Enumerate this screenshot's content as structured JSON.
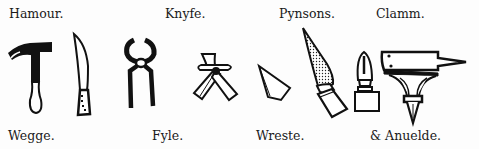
{
  "illustration": {
    "labels_top": [
      {
        "text": "Hamour.",
        "x": 9,
        "y": 8
      },
      {
        "text": "Knyfe.",
        "x": 165,
        "y": 8
      },
      {
        "text": "Pynsons.",
        "x": 279,
        "y": 8
      },
      {
        "text": "Clamm.",
        "x": 376,
        "y": 8
      }
    ],
    "labels_bottom": [
      {
        "text": "Wegge.",
        "x": 8,
        "y": 130
      },
      {
        "text": "Fyle.",
        "x": 152,
        "y": 130
      },
      {
        "text": "Wreste.",
        "x": 256,
        "y": 130
      },
      {
        "text": "& Anuelde.",
        "x": 370,
        "y": 130
      }
    ],
    "tools": [
      {
        "name": "hammer",
        "icon": "hammer-icon"
      },
      {
        "name": "knife",
        "icon": "knife-icon"
      },
      {
        "name": "pincers",
        "icon": "pincers-icon"
      },
      {
        "name": "wrest",
        "icon": "wrest-icon"
      },
      {
        "name": "wedge",
        "icon": "wedge-icon"
      },
      {
        "name": "file",
        "icon": "file-icon"
      },
      {
        "name": "clamp",
        "icon": "clamp-icon"
      },
      {
        "name": "anvil",
        "icon": "anvil-icon"
      }
    ],
    "ink_color": "#111111",
    "paper_color": "#fdfdfd"
  }
}
